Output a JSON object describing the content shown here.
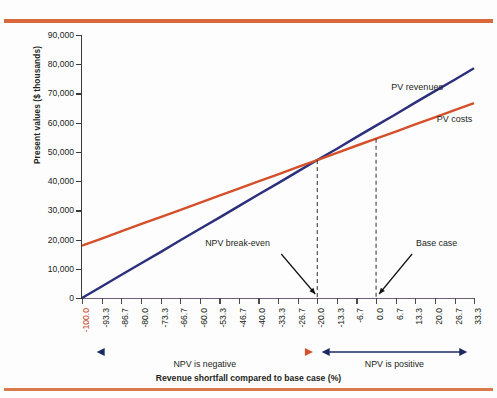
{
  "figure": {
    "y_axis_title": "Present values ($ thousands)",
    "x_axis_title": "Revenue shortfall compared to base case (%)"
  },
  "series_labels": {
    "revenues": "PV revenues",
    "costs": "PV costs"
  },
  "annotations": {
    "breakeven": "NPV break-even",
    "base_case": "Base case"
  },
  "bands": {
    "negative": "NPV is negative",
    "positive": "NPV is positive"
  },
  "colors": {
    "revenues_line": "#2b2f7c",
    "costs_line": "#d4502a",
    "rule": "#d9693c",
    "axis": "#3b3b3b",
    "first_tick_label": "#c4452a"
  },
  "chart_data": {
    "type": "line",
    "title": "",
    "xlabel": "Revenue shortfall compared to base case (%)",
    "ylabel": "Present values ($ thousands)",
    "xlim": [
      -100.0,
      33.3
    ],
    "ylim": [
      0,
      90000
    ],
    "grid": false,
    "legend_position": "inline-right",
    "x_tick_labels": [
      "-100.0",
      "-93.3",
      "-86.7",
      "-80.0",
      "-73.3",
      "-66.7",
      "-60.0",
      "-53.3",
      "-46.7",
      "-40.0",
      "-33.3",
      "-26.7",
      "-20.0",
      "-13.3",
      "-6.7",
      "0.0",
      "6.7",
      "13.3",
      "20.0",
      "26.7",
      "33.3"
    ],
    "x": [
      -100.0,
      -93.3,
      -86.7,
      -80.0,
      -73.3,
      -66.7,
      -60.0,
      -53.3,
      -46.7,
      -40.0,
      -33.3,
      -26.7,
      -20.0,
      -13.3,
      -6.7,
      0.0,
      6.7,
      13.3,
      20.0,
      26.7,
      33.3
    ],
    "y_tick_labels": [
      "0",
      "10,000",
      "20,000",
      "30,000",
      "40,000",
      "50,000",
      "60,000",
      "70,000",
      "80,000",
      "90,000"
    ],
    "y_ticks": [
      0,
      10000,
      20000,
      30000,
      40000,
      50000,
      60000,
      70000,
      80000,
      90000
    ],
    "series": [
      {
        "name": "PV revenues",
        "color": "#2b2f7c",
        "values": [
          0,
          3950,
          7850,
          11800,
          15700,
          19650,
          23600,
          27500,
          31450,
          35400,
          39300,
          43250,
          47200,
          51100,
          55050,
          59000,
          62900,
          66850,
          70800,
          74700,
          78650
        ]
      },
      {
        "name": "PV costs",
        "color": "#d4502a",
        "values": [
          17900,
          20350,
          22800,
          25250,
          27700,
          30100,
          32550,
          35000,
          37450,
          39900,
          42300,
          44750,
          47200,
          49650,
          52100,
          54500,
          56950,
          59400,
          61850,
          64300,
          66700
        ]
      }
    ],
    "markers": [
      {
        "label": "NPV break-even",
        "x": -20.0,
        "y": 47200,
        "style": "dashed-vertical"
      },
      {
        "label": "Base case",
        "x": 0.0,
        "y": 54500,
        "style": "dashed-vertical"
      }
    ],
    "regions": [
      {
        "label": "NPV is negative",
        "x_from": -100.0,
        "x_to": -20.0
      },
      {
        "label": "NPV is positive",
        "x_from": -20.0,
        "x_to": 33.3
      }
    ]
  }
}
